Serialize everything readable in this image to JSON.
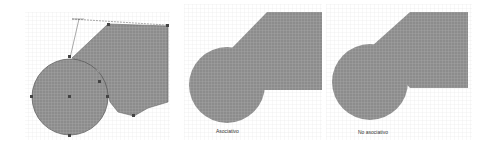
{
  "figure": {
    "panels": [
      {
        "id": "editing",
        "caption": "",
        "description": "Circle and polygon with selection handles and construction lines"
      },
      {
        "id": "associative",
        "caption": "Asociativo"
      },
      {
        "id": "non-associative",
        "caption": "No asociativo"
      }
    ],
    "colors": {
      "fill": "#8a8a8a",
      "fill_dark": "#7a7a7a",
      "grid_line": "#e4e4e4",
      "outline": "#555555",
      "handle": "#444444",
      "background": "#ffffff"
    }
  }
}
